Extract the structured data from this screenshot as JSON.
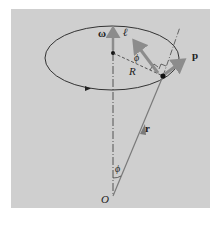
{
  "diagram": {
    "type": "physics-angular-momentum-conical-motion",
    "labels": {
      "omega": "ω⃗",
      "ell": "ℓ⃗",
      "p": "p⃗",
      "r": "r⃗",
      "R": "R",
      "phi_top": "ϕ",
      "phi_bottom": "ϕ",
      "origin": "O"
    },
    "colors": {
      "background": "#cfcfcf",
      "outline": "#333333",
      "vector_arrow": "#8c8c8c",
      "r_line": "#7a7a7a"
    },
    "elements": [
      "circular orbit drawn as ellipse with direction arrow",
      "vertical rotation axis through center",
      "angular velocity vector ω along axis",
      "radius R from center to particle",
      "angular momentum vector ℓ perpendicular to r",
      "linear momentum vector p tangent to orbit",
      "position vector r from origin O to particle",
      "angle ϕ between axis and r at O",
      "angle ϕ between ℓ and R at particle"
    ]
  }
}
